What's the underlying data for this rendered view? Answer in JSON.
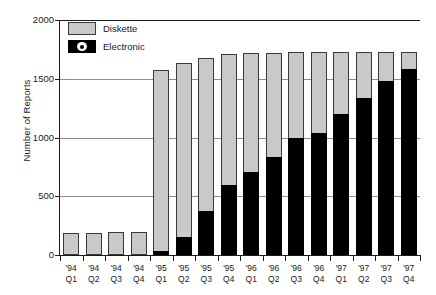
{
  "chart_data": {
    "type": "bar",
    "stacked": true,
    "title": "",
    "xlabel": "",
    "ylabel": "Number of Reports",
    "ylim": [
      0,
      2000
    ],
    "yticks": [
      0,
      500,
      1000,
      1500,
      2000
    ],
    "grid": true,
    "legend_position": "top-left",
    "categories": [
      {
        "year": "'94",
        "quarter": "Q1"
      },
      {
        "year": "'94",
        "quarter": "Q2"
      },
      {
        "year": "'94",
        "quarter": "Q3"
      },
      {
        "year": "'94",
        "quarter": "Q4"
      },
      {
        "year": "'95",
        "quarter": "Q1"
      },
      {
        "year": "'95",
        "quarter": "Q2"
      },
      {
        "year": "'95",
        "quarter": "Q3"
      },
      {
        "year": "'95",
        "quarter": "Q4"
      },
      {
        "year": "'96",
        "quarter": "Q1"
      },
      {
        "year": "'96",
        "quarter": "Q2"
      },
      {
        "year": "'96",
        "quarter": "Q3"
      },
      {
        "year": "'96",
        "quarter": "Q4"
      },
      {
        "year": "'97",
        "quarter": "Q1"
      },
      {
        "year": "'97",
        "quarter": "Q2"
      },
      {
        "year": "'97",
        "quarter": "Q3"
      },
      {
        "year": "'97",
        "quarter": "Q4"
      }
    ],
    "series": [
      {
        "name": "Electronic",
        "color": "#000000",
        "values": [
          0,
          0,
          0,
          0,
          30,
          150,
          375,
          600,
          710,
          830,
          1000,
          1040,
          1200,
          1340,
          1480,
          1580
        ]
      },
      {
        "name": "Diskette",
        "color": "#c9c9c9",
        "values": [
          185,
          190,
          195,
          200,
          1545,
          1480,
          1305,
          1115,
          1010,
          890,
          730,
          690,
          530,
          390,
          250,
          150
        ]
      }
    ],
    "totals": [
      185,
      190,
      195,
      200,
      1575,
      1630,
      1680,
      1715,
      1720,
      1720,
      1730,
      1730,
      1730,
      1730,
      1730,
      1730
    ]
  },
  "legend": {
    "items": [
      {
        "label": "Diskette",
        "swatch": "diskette-swatch"
      },
      {
        "label": "Electronic",
        "swatch": "electronic-swatch"
      }
    ]
  },
  "axis": {
    "y_title": "Number of Reports",
    "y_tick_labels": [
      "2000",
      "1500",
      "1000",
      "500",
      "0"
    ]
  }
}
